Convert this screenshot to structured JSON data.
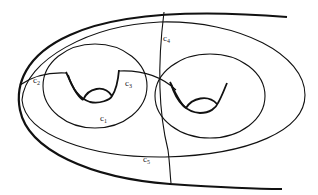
{
  "figure": {
    "stroke_color": "#111111",
    "background": "#ffffff"
  },
  "labels": {
    "c1": {
      "base": "c",
      "sub": "1"
    },
    "c2": {
      "base": "c",
      "sub": "2"
    },
    "c3": {
      "base": "c",
      "sub": "3"
    },
    "c4": {
      "base": "c",
      "sub": "4"
    },
    "c5": {
      "base": "c",
      "sub": "5"
    }
  }
}
